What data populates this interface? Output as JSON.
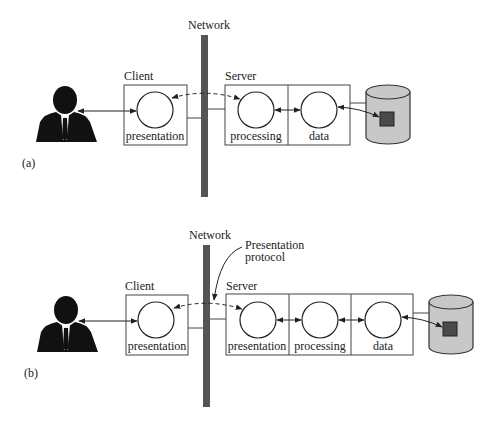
{
  "colors": {
    "network_bar": "#555555",
    "line": "#222222",
    "db_fill": "#c8c8c8",
    "db_record": "#4a4a4a",
    "person": "#111111"
  },
  "panel_a": {
    "tag": "(a)",
    "network_label": "Network",
    "client": {
      "label": "Client",
      "components": [
        "presentation"
      ]
    },
    "server": {
      "label": "Server",
      "components": [
        "processing",
        "data"
      ]
    }
  },
  "panel_b": {
    "tag": "(b)",
    "network_label": "Network",
    "annotation_line1": "Presentation",
    "annotation_line2": "protocol",
    "client": {
      "label": "Client",
      "components": [
        "presentation"
      ]
    },
    "server": {
      "label": "Server",
      "components": [
        "presentation",
        "processing",
        "data"
      ]
    }
  }
}
